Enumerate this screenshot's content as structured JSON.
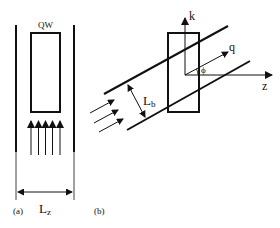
{
  "panel_a": {
    "caption": "(a)",
    "box_label": "QW",
    "width_label_main": "L",
    "width_label_sub": "z",
    "arrow_count": 5
  },
  "panel_b": {
    "caption": "(b)",
    "axis_vertical_label": "k",
    "axis_horizontal_label": "z",
    "vector_label": "q",
    "angle_label": "ϕ",
    "beam_width_label_main": "L",
    "beam_width_label_sub": "b",
    "arrow_count": 3
  },
  "colors": {
    "line": "#111111",
    "background": "#ffffff"
  }
}
